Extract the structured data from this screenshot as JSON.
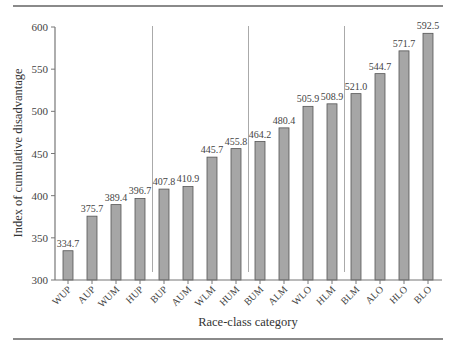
{
  "figure": {
    "caption_fragment": ""
  },
  "chart_data": {
    "type": "bar",
    "title": "",
    "xlabel": "Race-class category",
    "ylabel": "Index of cumulative disadvantage",
    "ylim": [
      300,
      600
    ],
    "yticks": [
      300,
      350,
      400,
      450,
      500,
      550,
      600
    ],
    "grid": false,
    "legend": null,
    "bar_color": "#a6a6a6",
    "bar_edge_color": "#555555",
    "group_separators_after_index": [
      3,
      7,
      11
    ],
    "categories": [
      "WUP",
      "AUP",
      "WUM",
      "HUP",
      "BUP",
      "AUM",
      "WLM",
      "HUM",
      "BUM",
      "ALM",
      "WLO",
      "HLM",
      "BLM",
      "ALO",
      "HLO",
      "BLO"
    ],
    "values": [
      334.7,
      375.7,
      389.4,
      396.7,
      407.8,
      410.9,
      445.7,
      455.8,
      464.2,
      480.4,
      505.9,
      508.9,
      521.0,
      544.7,
      571.7,
      592.5
    ],
    "value_labels": [
      "334.7",
      "375.7",
      "389.4",
      "396.7",
      "407.8",
      "410.9",
      "445.7",
      "455.8",
      "464.2",
      "480.4",
      "505.9",
      "508.9",
      "521.0",
      "544.7",
      "571.7",
      "592.5"
    ]
  }
}
